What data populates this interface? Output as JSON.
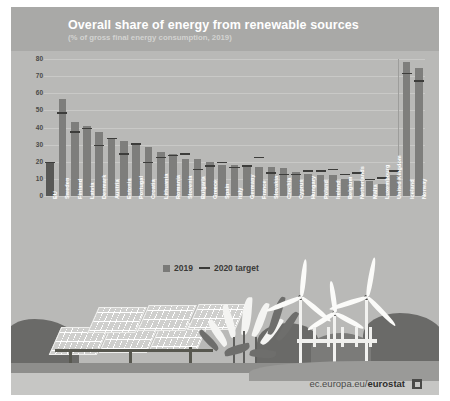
{
  "poster": {
    "title": "Overall share of energy from renewable sources",
    "subtitle": "(% of gross final energy consumption, 2019)",
    "footer_url_prefix": "ec.europa.eu/",
    "footer_url_brand": "eurostat",
    "colors": {
      "background": "#b9b9b7",
      "header": "#a9a9a7",
      "bar_2019": "#7e7e7c",
      "bar_eu": "#585856",
      "target_line": "#3d3d3b",
      "grid": "#c9c9c7",
      "label": "#ffffff",
      "footer_band": "#c6c6c4"
    }
  },
  "legend": {
    "position": "below-plot",
    "items": [
      {
        "label": "2019",
        "marker": "square"
      },
      {
        "label": "2020 target",
        "marker": "line"
      }
    ]
  },
  "chart_data": {
    "type": "bar",
    "title": "Overall share of energy from renewable sources",
    "subtitle": "(% of gross final energy consumption, 2019)",
    "xlabel": "",
    "ylabel": "",
    "ylim": [
      0,
      80
    ],
    "yticks": [
      0,
      10,
      20,
      30,
      40,
      50,
      60,
      70,
      80
    ],
    "grid": true,
    "legend_position": "bottom-left",
    "categories": [
      "EU",
      "Sweden",
      "Finland",
      "Latvia",
      "Denmark",
      "Austria",
      "Estonia",
      "Portugal",
      "Croatia",
      "Lithuania",
      "Romania",
      "Slovenia",
      "Bulgaria",
      "Greece",
      "Spain",
      "Italy",
      "Germany",
      "France",
      "Slovakia",
      "Czechia",
      "Cyprus",
      "Hungary",
      "Poland",
      "Ireland",
      "Belgium",
      "Netherlands",
      "Malta",
      "Luxembourg",
      "United Kingdom",
      "Iceland",
      "Norway"
    ],
    "series": [
      {
        "name": "2019",
        "type": "bar",
        "values": [
          19.7,
          56.4,
          43.1,
          41.0,
          37.2,
          33.6,
          31.9,
          30.6,
          28.5,
          25.5,
          24.3,
          21.9,
          21.6,
          19.7,
          18.4,
          18.2,
          17.4,
          17.2,
          16.9,
          16.2,
          13.8,
          12.6,
          12.2,
          12.0,
          9.9,
          8.8,
          8.5,
          7.0,
          12.3,
          78.2,
          74.6
        ]
      },
      {
        "name": "2020 target",
        "type": "marker-line",
        "values": [
          20.0,
          49.0,
          38.0,
          40.0,
          30.0,
          34.0,
          25.0,
          31.0,
          20.0,
          23.0,
          24.0,
          25.0,
          16.0,
          18.0,
          20.0,
          17.0,
          18.0,
          23.0,
          14.0,
          13.0,
          13.0,
          14.9,
          15.0,
          16.0,
          13.0,
          14.0,
          10.0,
          11.0,
          15.0,
          72.0,
          67.5
        ]
      }
    ],
    "note": "EU aggregate bar shown darker; Iceland and Norway shown after a separator as non-EU countries"
  },
  "illustration": {
    "elements": [
      "solar-panels",
      "crops",
      "wind-turbines",
      "hills",
      "fence"
    ]
  }
}
